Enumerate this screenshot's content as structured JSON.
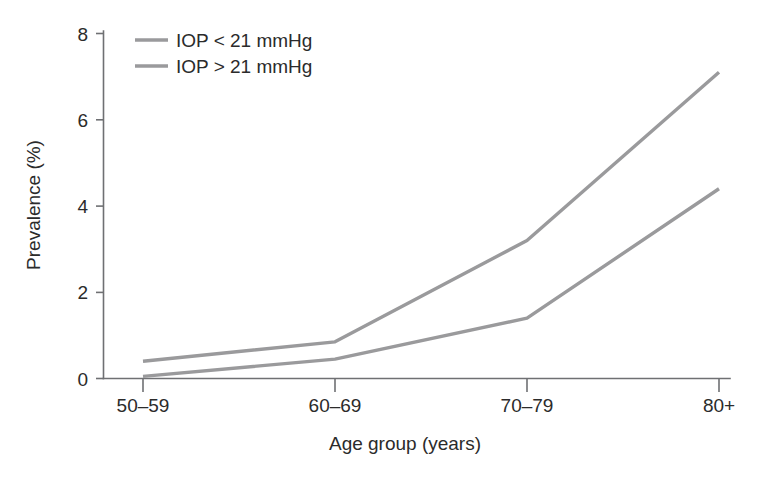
{
  "chart_data": {
    "type": "line",
    "title": "",
    "xlabel": "Age group (years)",
    "ylabel": "Prevalence (%)",
    "categories": [
      "50–59",
      "60–69",
      "70–79",
      "80+"
    ],
    "ylim": [
      0,
      8
    ],
    "yticks": [
      0,
      2,
      4,
      6,
      8
    ],
    "ytick_labels": [
      "0",
      "2",
      "4",
      "6",
      "8"
    ],
    "grid": false,
    "legend_position": "top-left",
    "series": [
      {
        "name": "IOP < 21 mmHg",
        "color": "#9a9a9c",
        "values": [
          0.4,
          0.85,
          3.2,
          7.1
        ]
      },
      {
        "name": "IOP > 21 mmHg",
        "color": "#9a9a9c",
        "values": [
          0.05,
          0.45,
          1.4,
          4.4
        ]
      }
    ]
  },
  "axes": {
    "y_label": "Prevalence (%)",
    "x_label": "Age group (years)",
    "y_ticks": [
      "8",
      "6",
      "4",
      "2",
      "0"
    ],
    "x_ticks": [
      "50–59",
      "60–69",
      "70–79",
      "80+"
    ]
  },
  "legend": {
    "items": [
      {
        "label": "IOP < 21 mmHg"
      },
      {
        "label": "IOP > 21 mmHg"
      }
    ]
  },
  "colors": {
    "series_line": "#9a9a9c",
    "axis": "#6f7073",
    "text": "#2b2b2b",
    "background": "#ffffff"
  }
}
